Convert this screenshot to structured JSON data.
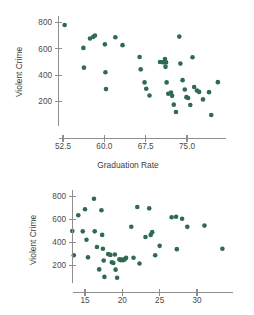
{
  "figure": {
    "background": "#ffffff",
    "marker_color": "#2e6b4f",
    "axis_color": "#8e8e8e"
  },
  "chart_data": [
    {
      "type": "scatter",
      "id": "violent-crime-vs-graduation-rate",
      "title": "",
      "xlabel": "Graduation Rate",
      "ylabel": "Violent Crime",
      "xlim": [
        49.5,
        82.0
      ],
      "ylim": [
        40,
        840
      ],
      "grid": false,
      "legend": null,
      "xticks": [
        52.5,
        60.0,
        67.5,
        75.0
      ],
      "xticklabels": [
        "52.5",
        "60.0",
        "67.5",
        "75.0"
      ],
      "yticks": [
        200,
        400,
        600,
        800
      ],
      "yticklabels": [
        "200",
        "400",
        "600",
        "800"
      ],
      "points": [
        {
          "x": 52.8,
          "y": 781
        },
        {
          "x": 56.2,
          "y": 607
        },
        {
          "x": 56.3,
          "y": 457
        },
        {
          "x": 57.4,
          "y": 678
        },
        {
          "x": 58.0,
          "y": 691
        },
        {
          "x": 58.3,
          "y": 701
        },
        {
          "x": 60.1,
          "y": 634
        },
        {
          "x": 60.2,
          "y": 422
        },
        {
          "x": 60.3,
          "y": 294
        },
        {
          "x": 62.0,
          "y": 688
        },
        {
          "x": 63.3,
          "y": 628
        },
        {
          "x": 66.4,
          "y": 538
        },
        {
          "x": 66.6,
          "y": 444
        },
        {
          "x": 67.3,
          "y": 345
        },
        {
          "x": 67.6,
          "y": 297
        },
        {
          "x": 68.2,
          "y": 246
        },
        {
          "x": 70.1,
          "y": 500
        },
        {
          "x": 70.6,
          "y": 498
        },
        {
          "x": 70.9,
          "y": 498
        },
        {
          "x": 71.2,
          "y": 497
        },
        {
          "x": 71.0,
          "y": 523
        },
        {
          "x": 71.1,
          "y": 463
        },
        {
          "x": 71.3,
          "y": 345
        },
        {
          "x": 71.6,
          "y": 259
        },
        {
          "x": 72.1,
          "y": 268
        },
        {
          "x": 72.3,
          "y": 243
        },
        {
          "x": 72.6,
          "y": 176
        },
        {
          "x": 73.0,
          "y": 120
        },
        {
          "x": 73.6,
          "y": 693
        },
        {
          "x": 73.8,
          "y": 488
        },
        {
          "x": 74.2,
          "y": 362
        },
        {
          "x": 74.6,
          "y": 291
        },
        {
          "x": 74.9,
          "y": 233
        },
        {
          "x": 75.2,
          "y": 227
        },
        {
          "x": 75.6,
          "y": 173
        },
        {
          "x": 76.0,
          "y": 536
        },
        {
          "x": 76.3,
          "y": 310
        },
        {
          "x": 76.8,
          "y": 284
        },
        {
          "x": 77.2,
          "y": 273
        },
        {
          "x": 77.9,
          "y": 216
        },
        {
          "x": 79.0,
          "y": 271
        },
        {
          "x": 79.4,
          "y": 97
        },
        {
          "x": 80.6,
          "y": 347
        }
      ]
    },
    {
      "type": "scatter",
      "id": "violent-crime-vs-second-predictor",
      "title": "",
      "xlabel": "",
      "ylabel": "Violent Crime",
      "xlim": [
        12.0,
        34.5
      ],
      "ylim": [
        40,
        840
      ],
      "grid": false,
      "legend": null,
      "xticks": [
        15,
        20,
        25,
        30
      ],
      "xticklabels": [
        "15",
        "20",
        "25",
        "30"
      ],
      "yticks": [
        200,
        400,
        600,
        800
      ],
      "yticklabels": [
        "200",
        "400",
        "600",
        "800"
      ],
      "points": [
        {
          "x": 13.3,
          "y": 500
        },
        {
          "x": 13.5,
          "y": 289
        },
        {
          "x": 14.1,
          "y": 637
        },
        {
          "x": 14.7,
          "y": 497
        },
        {
          "x": 15.0,
          "y": 689
        },
        {
          "x": 15.2,
          "y": 424
        },
        {
          "x": 15.4,
          "y": 271
        },
        {
          "x": 16.2,
          "y": 781
        },
        {
          "x": 16.3,
          "y": 497
        },
        {
          "x": 16.6,
          "y": 361
        },
        {
          "x": 16.9,
          "y": 166
        },
        {
          "x": 17.2,
          "y": 680
        },
        {
          "x": 17.3,
          "y": 466
        },
        {
          "x": 17.4,
          "y": 346
        },
        {
          "x": 17.5,
          "y": 244
        },
        {
          "x": 17.6,
          "y": 101
        },
        {
          "x": 18.1,
          "y": 299
        },
        {
          "x": 18.4,
          "y": 292
        },
        {
          "x": 18.6,
          "y": 228
        },
        {
          "x": 18.8,
          "y": 222
        },
        {
          "x": 19.0,
          "y": 296
        },
        {
          "x": 19.1,
          "y": 164
        },
        {
          "x": 19.3,
          "y": 94
        },
        {
          "x": 19.6,
          "y": 253
        },
        {
          "x": 19.8,
          "y": 245
        },
        {
          "x": 19.9,
          "y": 251
        },
        {
          "x": 20.1,
          "y": 247
        },
        {
          "x": 20.3,
          "y": 253
        },
        {
          "x": 20.5,
          "y": 266
        },
        {
          "x": 21.2,
          "y": 537
        },
        {
          "x": 21.5,
          "y": 268
        },
        {
          "x": 22.0,
          "y": 709
        },
        {
          "x": 22.3,
          "y": 217
        },
        {
          "x": 23.1,
          "y": 448
        },
        {
          "x": 23.6,
          "y": 697
        },
        {
          "x": 23.8,
          "y": 466
        },
        {
          "x": 24.0,
          "y": 490
        },
        {
          "x": 24.4,
          "y": 289
        },
        {
          "x": 25.0,
          "y": 371
        },
        {
          "x": 26.6,
          "y": 620
        },
        {
          "x": 27.2,
          "y": 624
        },
        {
          "x": 27.3,
          "y": 342
        },
        {
          "x": 28.0,
          "y": 607
        },
        {
          "x": 28.7,
          "y": 536
        },
        {
          "x": 31.0,
          "y": 547
        },
        {
          "x": 33.4,
          "y": 346
        }
      ]
    }
  ]
}
